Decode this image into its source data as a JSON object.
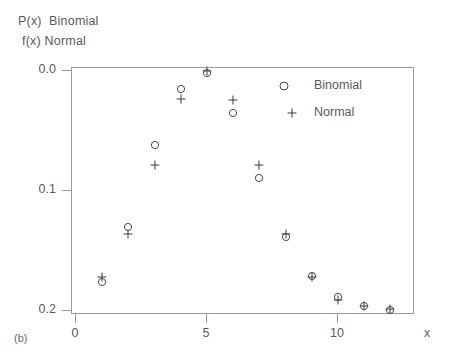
{
  "title": {
    "line1": "P(x)  Binomial",
    "line2": "f(x) Normal"
  },
  "caption": "(b)",
  "legend": {
    "binomial": {
      "label": "Binomial",
      "symbol": "circle-marker"
    },
    "normal": {
      "label": "Normal",
      "symbol": "plus-marker"
    }
  },
  "axes": {
    "x_label": "x",
    "x_ticks": [
      "0",
      "5",
      "10"
    ],
    "y_ticks": [
      "0.2",
      "0.1",
      "0.0"
    ]
  },
  "colors": {
    "frame": "#9a9a9a",
    "text": "#5a5a5a",
    "marker": "#4a4a4a",
    "background": "#ffffff"
  },
  "chart_data": {
    "type": "scatter",
    "xlabel": "x",
    "ylabel": "P(x) Binomial, f(x) Normal",
    "xlim": [
      0,
      13
    ],
    "ylim": [
      0.0,
      0.21
    ],
    "grid": false,
    "legend_position": "top-right inside",
    "x": [
      1,
      2,
      3,
      4,
      5,
      6,
      7,
      8,
      9,
      10,
      11,
      12
    ],
    "series": [
      {
        "name": "Binomial",
        "marker": "circle",
        "values": [
          0.024,
          0.07,
          0.138,
          0.185,
          0.198,
          0.165,
          0.111,
          0.062,
          0.029,
          0.012,
          0.004,
          0.001
        ]
      },
      {
        "name": "Normal",
        "marker": "plus",
        "values": [
          0.028,
          0.064,
          0.122,
          0.177,
          0.2,
          0.176,
          0.122,
          0.064,
          0.028,
          0.009,
          0.004,
          0.002
        ]
      }
    ],
    "x_tick_values": [
      0,
      5,
      10
    ],
    "y_tick_values": [
      0.0,
      0.1,
      0.2
    ]
  }
}
